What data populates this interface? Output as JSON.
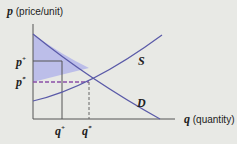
{
  "diagram": {
    "y_axis_label_var": "p",
    "y_axis_label_text": " (price/unit)",
    "x_axis_label_var": "q",
    "x_axis_label_text": " (quantity)",
    "supply_label": "S",
    "demand_label": "D",
    "p_plus": "p",
    "p_star": "p",
    "q_plus": "q",
    "q_star": "q",
    "plus_sup": "+",
    "star_sup": "*",
    "colors": {
      "curve": "#5a5aa8",
      "shade": "#b4b6ea",
      "dash": "#8a4fa8",
      "axis": "#555555"
    }
  }
}
